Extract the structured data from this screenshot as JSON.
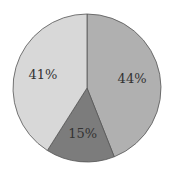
{
  "chart_data": {
    "type": "pie",
    "title": "",
    "start_angle": "12 o'clock",
    "direction": "clockwise",
    "categories": [
      "A",
      "B",
      "C"
    ],
    "values": [
      44,
      15,
      41
    ],
    "labels": [
      "44%",
      "15%",
      "41%"
    ],
    "colors": [
      "#b0b0b0",
      "#7c7c7c",
      "#d8d8d8"
    ],
    "legend": "none"
  }
}
